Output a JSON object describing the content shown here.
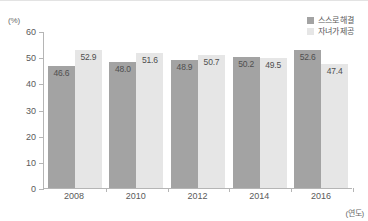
{
  "chart_data": {
    "type": "bar",
    "title": "",
    "subtitle": "",
    "xlabel": "(연도)",
    "ylabel": "(%)",
    "categories": [
      "2008",
      "2010",
      "2012",
      "2014",
      "2016"
    ],
    "series": [
      {
        "name": "스스로 해결",
        "color": "#a3a3a3",
        "values": [
          46.6,
          48.0,
          48.9,
          50.2,
          52.6
        ],
        "labels": [
          "46.6",
          "48.0",
          "48.9",
          "50.2",
          "52.6"
        ]
      },
      {
        "name": "자녀가 제공",
        "color": "#e6e6e6",
        "values": [
          52.9,
          51.6,
          50.7,
          49.5,
          47.4
        ],
        "labels": [
          "52.9",
          "51.6",
          "50.7",
          "49.5",
          "47.4"
        ]
      }
    ],
    "ylim": [
      0,
      60
    ],
    "yticks": [
      60,
      50,
      40,
      30,
      20,
      10,
      0
    ],
    "ytick_labels": [
      "60",
      "50",
      "40",
      "30",
      "20",
      "10",
      "0"
    ],
    "grid": false,
    "legend_position": "top-right",
    "axis_color": "#b5b5b5"
  }
}
